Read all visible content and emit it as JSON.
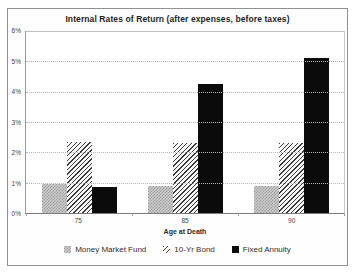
{
  "chart_data": {
    "type": "bar",
    "title": "Internal Rates of Return (after expenses, before taxes)",
    "categories": [
      "75",
      "85",
      "90"
    ],
    "series": [
      {
        "name": "Money Market Fund",
        "pattern": "textured-gray",
        "values": [
          0.95,
          0.9,
          0.9
        ]
      },
      {
        "name": "10-Yr Bond",
        "pattern": "diagonal-hatch",
        "values": [
          2.35,
          2.3,
          2.3
        ]
      },
      {
        "name": "Fixed Annuity",
        "pattern": "solid-black",
        "values": [
          0.85,
          4.25,
          5.1
        ]
      }
    ],
    "xlabel": "Age at Death",
    "ylabel": "",
    "ylim": [
      0,
      6
    ],
    "yticks": [
      0,
      1,
      2,
      3,
      4,
      5,
      6
    ],
    "ytick_labels": [
      "0%",
      "1%",
      "2%",
      "3%",
      "4%",
      "5%",
      "6%"
    ],
    "grid": true,
    "legend_position": "bottom"
  },
  "colors": {
    "frame_border": "#919191",
    "grid_line": "#b5b5b5",
    "axis_line": "#7a7a7a",
    "bar_gray": "#cfcfcf",
    "bar_gray_texture": "#9a9a9a",
    "hatch_line": "#3c3c3c",
    "hatch_background": "#f7f7f7",
    "annuity_black": "#0b0b0b",
    "text": "#2f2f2f"
  }
}
